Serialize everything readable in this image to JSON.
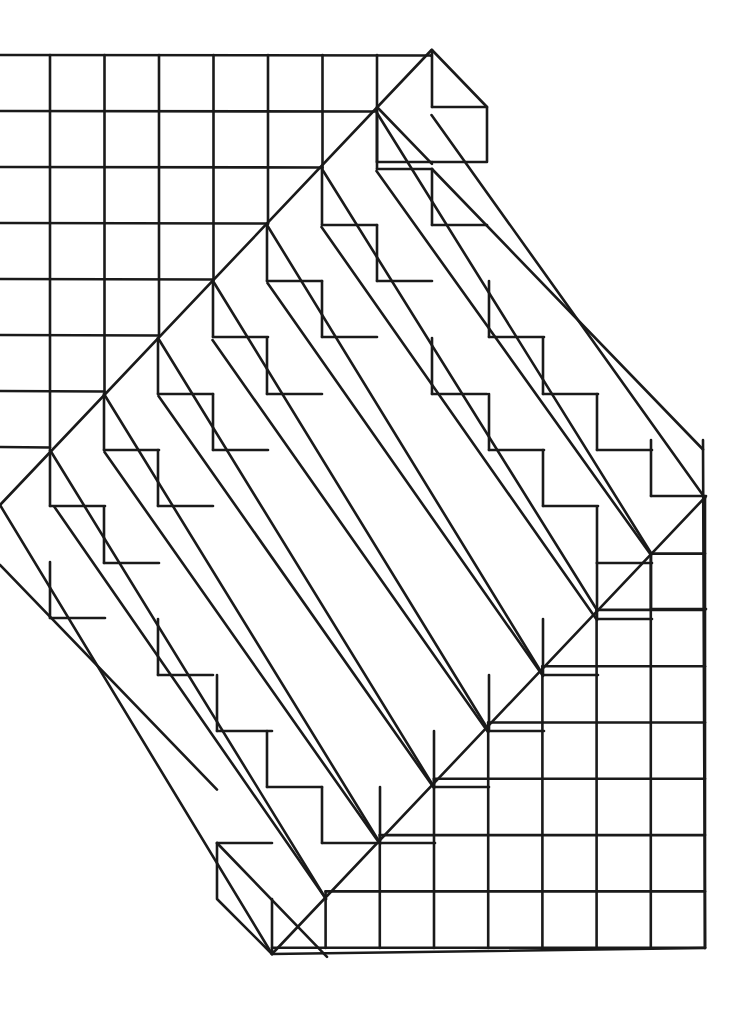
{
  "figure": {
    "stroke_color": "#1a1a1a",
    "background_color": "#ffffff",
    "stroke_width": 2.6
  },
  "geometry": {
    "grid_pitch_x": 54.5,
    "grid_pitch_y": 56,
    "upper_grid": {
      "rows_y": [
        56,
        113,
        169,
        225,
        281,
        338,
        394,
        450
      ],
      "cols_x": [
        50,
        104,
        158,
        213,
        267,
        322,
        377,
        432
      ]
    },
    "lower_grid": {
      "rows_y": [
        497,
        553,
        610,
        666,
        722,
        779,
        836,
        892,
        948
      ],
      "cols_x": [
        380,
        434,
        489,
        543,
        597,
        651,
        705
      ]
    },
    "outer_corners": {
      "top_apex": [
        432,
        50
      ],
      "top_box_right": [
        487,
        107
      ],
      "top_box_bottom": [
        487,
        162
      ],
      "right_edge_top": [
        703,
        440
      ],
      "bottom_right": [
        705,
        948
      ],
      "bottom_left_corner": [
        272,
        954
      ],
      "bottom_box_top": [
        217,
        843
      ],
      "bottom_box_mid": [
        217,
        899
      ],
      "left_point": [
        0,
        505
      ]
    }
  }
}
